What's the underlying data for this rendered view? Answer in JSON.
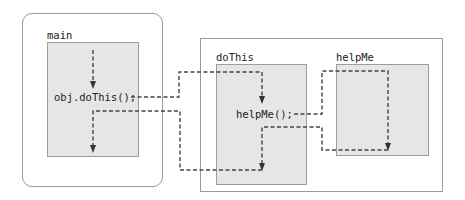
{
  "diagram": {
    "type": "method-call-flow",
    "main": {
      "title": "main",
      "statement": "obj.doThis();"
    },
    "doThis": {
      "title": "doThis",
      "statement": "helpMe();"
    },
    "helpMe": {
      "title": "helpMe"
    },
    "colors": {
      "frame_border": "#9a9a9a",
      "box_fill": "#e6e6e6",
      "box_border": "#9c9c9c",
      "arrow": "#333333"
    },
    "edges": [
      {
        "from": "main:obj.doThis()",
        "to": "doThis",
        "label": "call"
      },
      {
        "from": "doThis:helpMe()",
        "to": "helpMe",
        "label": "call"
      },
      {
        "from": "helpMe",
        "to": "doThis:after helpMe()",
        "label": "return"
      },
      {
        "from": "doThis",
        "to": "main:after obj.doThis()",
        "label": "return"
      }
    ]
  }
}
